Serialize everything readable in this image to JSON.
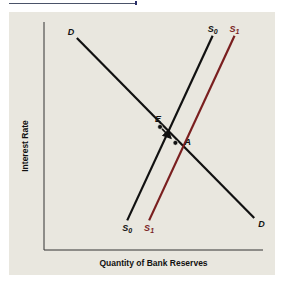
{
  "chart_data": {
    "type": "line",
    "title": "",
    "xlabel": "Quantity of Bank Reserves",
    "ylabel": "Interest Rate",
    "grid": false,
    "x_ticks": [],
    "y_ticks": [],
    "series": [
      {
        "name": "D",
        "label_start": "D",
        "label_end": "D",
        "color": "#111111",
        "points": [
          [
            1.5,
            9.3
          ],
          [
            9.6,
            1.4
          ]
        ]
      },
      {
        "name": "S0",
        "label_start": "S",
        "label_start_sub": "0",
        "label_end": "S",
        "label_end_sub": "0",
        "color": "#111111",
        "points": [
          [
            3.8,
            1.3
          ],
          [
            7.7,
            9.4
          ]
        ]
      },
      {
        "name": "S1",
        "label_start": "S",
        "label_start_sub": "1",
        "label_end": "S",
        "label_end_sub": "1",
        "color": "#7a1f1f",
        "points": [
          [
            4.8,
            1.3
          ],
          [
            8.7,
            9.4
          ]
        ]
      }
    ],
    "annotations": [
      {
        "label": "E",
        "point": [
          5.3,
          5.4
        ],
        "type": "equilibrium"
      },
      {
        "label": "A",
        "point": [
          6.0,
          4.7
        ],
        "type": "new-equilibrium"
      }
    ],
    "arrow": {
      "from": "E",
      "to": "A"
    },
    "xlim": [
      0,
      10
    ],
    "ylim": [
      0,
      10
    ]
  }
}
